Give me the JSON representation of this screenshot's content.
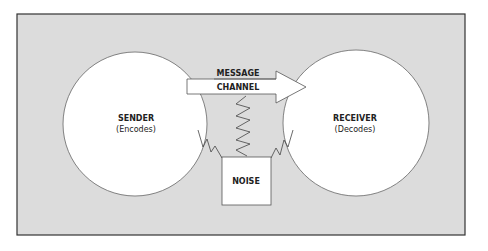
{
  "diagram": {
    "sender": {
      "label": "SENDER",
      "sublabel": "(Encodes)"
    },
    "receiver": {
      "label": "RECEIVER",
      "sublabel": "(Decodes)"
    },
    "arrow": {
      "top_label": "MESSAGE",
      "bottom_label": "CHANNEL"
    },
    "noise": {
      "label": "NOISE"
    },
    "colors": {
      "background": "#dcdcdc",
      "frame": "#333333",
      "shape_fill": "#ffffff",
      "stroke": "#555555",
      "text": "#222222"
    }
  }
}
